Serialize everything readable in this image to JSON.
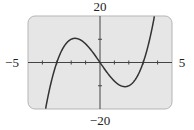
{
  "chart_data": {
    "type": "line",
    "title": "",
    "xlabel": "",
    "ylabel": "",
    "xlim": [
      -5,
      5
    ],
    "ylim": [
      -20,
      20
    ],
    "x_tick_step": 1,
    "y_tick_step": 10,
    "grid": false,
    "tick_labels": {
      "xmin": "−5",
      "xmax": "5",
      "ymax": "20",
      "ymin": "−20"
    },
    "series": [
      {
        "name": "f(x) = x^3 - 9x",
        "x": [
          -4.0,
          -3.5,
          -3.0,
          -2.5,
          -2.0,
          -1.732,
          -1.5,
          -1.0,
          -0.5,
          0.0,
          0.5,
          1.0,
          1.5,
          1.732,
          2.0,
          2.5,
          3.0,
          3.5,
          4.0
        ],
        "values": [
          -28,
          -11.4,
          0,
          6.9,
          10,
          10.39,
          10.1,
          8,
          4.4,
          0,
          -4.4,
          -8,
          -10.1,
          -10.39,
          -10,
          -6.9,
          0,
          11.4,
          28
        ]
      }
    ],
    "background": "#e6e6e6",
    "curve_color": "#333333",
    "axis_color": "#444444"
  }
}
